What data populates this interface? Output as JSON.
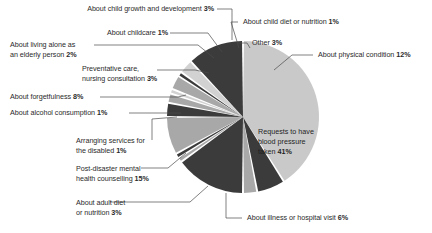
{
  "chart_data": {
    "type": "pie",
    "title": "",
    "subtitle": "",
    "xlabel": "",
    "ylabel": "",
    "legend_position": "callout-labels",
    "grid": false,
    "units": "%",
    "total": 100,
    "categories": [
      "Requests to have blood pressure taken",
      "About illness or hospital visit",
      "About adult diet or nutrition",
      "Post-disaster mental health counselling",
      "Arranging services for the disabled",
      "About alcohol consumption",
      "About forgetfulness",
      "Preventative care, nursing consultation",
      "About living alone as an elderly person",
      "About childcare",
      "About child growth and development",
      "About child diet or nutrition",
      "Other",
      "About physical condition"
    ],
    "values": [
      41,
      6,
      3,
      15,
      1,
      1,
      8,
      3,
      2,
      1,
      3,
      1,
      3,
      12
    ],
    "slices": [
      {
        "key": "blood-pressure",
        "label": "Requests to have blood pressure taken",
        "label_lines": [
          "Requests to have",
          "blood pressure",
          "taken"
        ],
        "value": 41,
        "value_text": "41%",
        "color": "#c9c9c9",
        "label_placement": "inside"
      },
      {
        "key": "illness-hospital-visit",
        "label": "About illness or hospital visit",
        "label_lines": [
          "About illness or hospital visit"
        ],
        "value": 6,
        "value_text": "6%",
        "color": "#3b3b3b",
        "label_placement": "callout-bottom-right"
      },
      {
        "key": "adult-diet",
        "label": "About adult diet or nutrition",
        "label_lines": [
          "About adult diet",
          "or nutrition"
        ],
        "value": 3,
        "value_text": "3%",
        "color": "#a8a8a8",
        "label_placement": "callout-left"
      },
      {
        "key": "post-disaster-mental-health",
        "label": "Post-disaster mental health counselling",
        "label_lines": [
          "Post-disaster mental",
          "health counselling"
        ],
        "value": 15,
        "value_text": "15%",
        "color": "#3b3b3b",
        "label_placement": "callout-left"
      },
      {
        "key": "services-for-disabled",
        "label": "Arranging services for the disabled",
        "label_lines": [
          "Arranging services for",
          "the disabled"
        ],
        "value": 1,
        "value_text": "1%",
        "color": "#a8a8a8",
        "label_placement": "callout-left"
      },
      {
        "key": "alcohol-consumption",
        "label": "About alcohol consumption",
        "label_lines": [
          "About alcohol consumption"
        ],
        "value": 1,
        "value_text": "1%",
        "color": "#3b3b3b",
        "label_placement": "callout-left"
      },
      {
        "key": "forgetfulness",
        "label": "About forgetfulness",
        "label_lines": [
          "About forgetfulness"
        ],
        "value": 8,
        "value_text": "8%",
        "color": "#a8a8a8",
        "label_placement": "callout-left"
      },
      {
        "key": "preventative-care",
        "label": "Preventative care, nursing consultation",
        "label_lines": [
          "Preventative care,",
          "nursing consultation"
        ],
        "value": 3,
        "value_text": "3%",
        "color": "#3b3b3b",
        "label_placement": "callout-left"
      },
      {
        "key": "living-alone-elderly",
        "label": "About living alone as an elderly person",
        "label_lines": [
          "About living alone as",
          "an elderly person"
        ],
        "value": 2,
        "value_text": "2%",
        "color": "#a8a8a8",
        "label_placement": "callout-left"
      },
      {
        "key": "childcare",
        "label": "About childcare",
        "label_lines": [
          "About childcare"
        ],
        "value": 1,
        "value_text": "1%",
        "color": "#d2d2d2",
        "label_placement": "callout-top-left"
      },
      {
        "key": "child-growth",
        "label": "About child growth and development",
        "label_lines": [
          "About child growth and development"
        ],
        "value": 3,
        "value_text": "3%",
        "color": "#a8a8a8",
        "label_placement": "callout-top-left"
      },
      {
        "key": "child-diet",
        "label": "About child diet or nutrition",
        "label_lines": [
          "About child diet or nutrition"
        ],
        "value": 1,
        "value_text": "1%",
        "color": "#3b3b3b",
        "label_placement": "callout-top-right"
      },
      {
        "key": "other",
        "label": "Other",
        "label_lines": [
          "Other"
        ],
        "value": 3,
        "value_text": "3%",
        "color": "#d2d2d2",
        "label_placement": "callout-top-right"
      },
      {
        "key": "physical-condition",
        "label": "About physical condition",
        "label_lines": [
          "About physical condition"
        ],
        "value": 12,
        "value_text": "12%",
        "color": "#3b3b3b",
        "label_placement": "callout-right"
      }
    ]
  },
  "callouts": {
    "child_growth": {
      "text": "About child growth and development ",
      "value": "3%"
    },
    "childcare": {
      "text": "About childcare ",
      "value": "1%"
    },
    "living_alone_l1": "About living alone as",
    "living_alone_l2": "an elderly person ",
    "living_alone_value": "2%",
    "preventative_l1": "Preventative care,",
    "preventative_l2": "nursing consultation  ",
    "preventative_value": "3%",
    "forgetfulness": {
      "text": "About forgetfulness  ",
      "value": "8%"
    },
    "alcohol": {
      "text": "About alcohol consumption  ",
      "value": "1%"
    },
    "disabled_l1": "Arranging services for",
    "disabled_l2": "the disabled ",
    "disabled_value": "1%",
    "postdisaster_l1": "Post-disaster mental",
    "postdisaster_l2": "health counselling ",
    "postdisaster_value": "15%",
    "adult_diet_l1": "About adult diet",
    "adult_diet_l2": "or nutrition ",
    "adult_diet_value": "3%",
    "child_diet": {
      "text": "About child diet or nutrition ",
      "value": "1%"
    },
    "other": {
      "text": "Other ",
      "value": "3%"
    },
    "physical": {
      "text": "About physical condition ",
      "value": "12%"
    },
    "illness": {
      "text": "About illness or hospital visit ",
      "value": "6%"
    },
    "blood_pressure_l1": "Requests to have",
    "blood_pressure_l2": "blood pressure",
    "blood_pressure_l3": "taken ",
    "blood_pressure_value": "41%"
  }
}
